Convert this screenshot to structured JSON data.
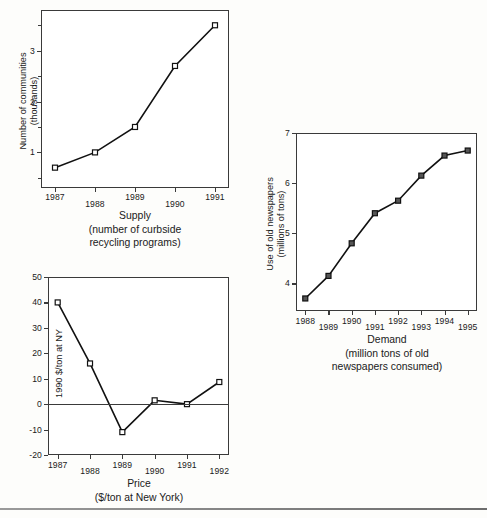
{
  "page": {
    "footer_rule": true
  },
  "chart_data": [
    {
      "id": "supply",
      "type": "line",
      "title": "",
      "caption": "Supply\n(number of curbside\nrecycling programs)",
      "xlabel": "",
      "ylabel": "Number of communities\n(thousands)",
      "categories": [
        "1987",
        "1988",
        "1989",
        "1990",
        "1991"
      ],
      "x": [
        1987,
        1988,
        1989,
        1990,
        1991
      ],
      "values": [
        0.7,
        1.0,
        1.5,
        2.7,
        3.5
      ],
      "yticks": [
        1,
        2,
        3
      ],
      "ytick_labels": [
        "1",
        "2",
        "3"
      ],
      "yminor": [
        0.5,
        1.5,
        2.5,
        3.5
      ],
      "ylim": [
        0.3,
        3.8
      ],
      "xlim": [
        1986.65,
        1991.35
      ],
      "grid": false,
      "legend": null,
      "marker": "open-square"
    },
    {
      "id": "demand",
      "type": "line",
      "title": "",
      "caption": "Demand\n(million tons of old\nnewspapers consumed)",
      "xlabel": "",
      "ylabel": "Use of old newspapers\n(millions of tons)",
      "categories": [
        "1988",
        "1989",
        "1990",
        "1991",
        "1992",
        "1993",
        "1994",
        "1995"
      ],
      "x": [
        1988,
        1989,
        1990,
        1991,
        1992,
        1993,
        1994,
        1995
      ],
      "values": [
        3.7,
        4.15,
        4.8,
        5.4,
        5.65,
        6.15,
        6.55,
        6.65
      ],
      "yticks": [
        4,
        5,
        6,
        7
      ],
      "ytick_labels": [
        "4",
        "5",
        "6",
        "7"
      ],
      "yminor": [],
      "ylim": [
        3.45,
        7.0
      ],
      "xlim": [
        1987.6,
        1995.4
      ],
      "grid": false,
      "legend": null,
      "marker": "filled-square"
    },
    {
      "id": "price",
      "type": "line",
      "title": "",
      "caption": "Price\n($/ton at New York)",
      "xlabel": "",
      "ylabel": "1990 $/ton at NY",
      "categories": [
        "1987",
        "1988",
        "1989",
        "1990",
        "1991",
        "1992"
      ],
      "x": [
        1987,
        1988,
        1989,
        1990,
        1991,
        1992
      ],
      "values": [
        40,
        16,
        -11,
        1.5,
        0,
        8.7
      ],
      "yticks": [
        -20,
        -10,
        0,
        10,
        20,
        30,
        40,
        50
      ],
      "ytick_labels": [
        "-20",
        "-10",
        "0",
        "10",
        "20",
        "30",
        "40",
        "50"
      ],
      "yminor": [],
      "ylim": [
        -20,
        50
      ],
      "xlim": [
        1986.7,
        1992.3
      ],
      "grid": false,
      "zero_line": 0,
      "legend": null,
      "marker": "open-square"
    }
  ]
}
